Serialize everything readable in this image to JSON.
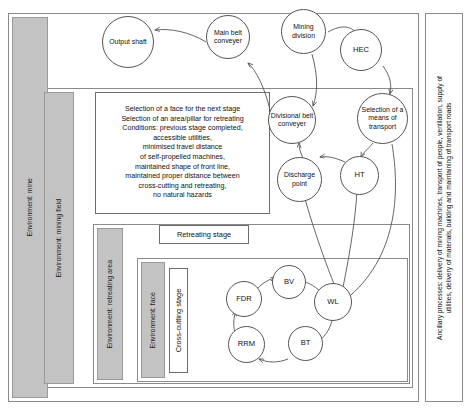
{
  "diagram": {
    "side_caption": "Ancillary processes: delivery of mining machines, transport of people, ventilation, supply of utilities, delivery of materials, building and maintaining of transport roads",
    "colors": {
      "band_fill": "#c3c3c3",
      "band_stroke": "#9a9a9a",
      "frame_stroke": "#8a8a8a",
      "node_stroke": "#555555",
      "node_fill": "#ffffff",
      "arrow_stroke": "#555555",
      "text": "#111111"
    },
    "environments": [
      {
        "id": "mine",
        "label": "Environment: mine"
      },
      {
        "id": "mining-field",
        "label": "Environment: mining field"
      },
      {
        "id": "retreating-area",
        "label": "Environment: retreating area"
      },
      {
        "id": "face",
        "label": "Environment: face"
      }
    ],
    "boxes": {
      "conditions": {
        "lines": [
          "Selection of a face for the next stage",
          "Selection of an area/pillar for retreating",
          "Conditions: previous stage completed,",
          "accessible utilities,",
          "minimised travel distance",
          "of self-propelled machines,",
          "maintained shape of front line,",
          "maintained proper distance between",
          "cross-cutting and retreating,",
          "no natural hazards"
        ]
      },
      "retreating_stage": {
        "label": "Retreating stage"
      },
      "cross_cutting_stage": {
        "label": "Cross-cutting stage"
      }
    },
    "nodes": [
      {
        "id": "output-shaft",
        "label": "Output shaft"
      },
      {
        "id": "main-belt",
        "label": "Main belt conveyer"
      },
      {
        "id": "mining-division",
        "label": "Mining division"
      },
      {
        "id": "hec",
        "label": "HEC"
      },
      {
        "id": "divisional-belt",
        "label": "Divisional belt conveyer"
      },
      {
        "id": "selection-transport",
        "label": "Selection of a means of transport"
      },
      {
        "id": "discharge-point",
        "label": "Discharge point"
      },
      {
        "id": "ht",
        "label": "HT"
      },
      {
        "id": "bv",
        "label": "BV"
      },
      {
        "id": "wl",
        "label": "WL"
      },
      {
        "id": "bt",
        "label": "BT"
      },
      {
        "id": "rrm",
        "label": "RRM"
      },
      {
        "id": "fdr",
        "label": "FDR"
      }
    ],
    "edges": [
      {
        "from": "main-belt",
        "to": "output-shaft"
      },
      {
        "from": "divisional-belt",
        "to": "main-belt"
      },
      {
        "from": "mining-division",
        "to": "hec"
      },
      {
        "from": "mining-division",
        "to": "divisional-belt"
      },
      {
        "from": "hec",
        "to": "selection-transport"
      },
      {
        "from": "discharge-point",
        "to": "divisional-belt"
      },
      {
        "from": "ht",
        "to": "discharge-point"
      },
      {
        "from": "selection-transport",
        "to": "ht"
      },
      {
        "from": "selection-transport",
        "to": "wl"
      },
      {
        "from": "wl",
        "to": "discharge-point"
      },
      {
        "from": "wl",
        "to": "ht"
      },
      {
        "from": "fdr",
        "to": "bv"
      },
      {
        "from": "bv",
        "to": "wl"
      },
      {
        "from": "wl",
        "to": "bt"
      },
      {
        "from": "bt",
        "to": "rrm"
      },
      {
        "from": "rrm",
        "to": "fdr"
      }
    ]
  }
}
